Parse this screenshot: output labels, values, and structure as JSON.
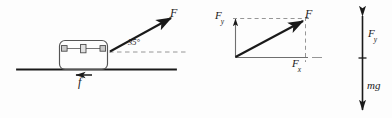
{
  "figure": {
    "background_color": "#fdfdfd",
    "ink_color": "#1a1a1a",
    "guide_color": "#8a8a8a"
  },
  "left_diagram": {
    "name": "box-on-ground-with-applied-force",
    "applied_force_label": "F",
    "angle_label": "35°",
    "angle_value": 35,
    "friction_label": "f",
    "ground_line": "horizontal surface",
    "box": "crate with lid seam and three latches"
  },
  "right_diagram": {
    "name": "force-component-triangle",
    "resultant_label": "F",
    "vertical_component_label": "F",
    "vertical_component_sub": "y",
    "horizontal_component_label": "F",
    "horizontal_component_sub": "x"
  },
  "vertical_diagram": {
    "name": "vertical-forces-scale",
    "upper_label": "F",
    "upper_sub": "y",
    "lower_label": "mg"
  }
}
